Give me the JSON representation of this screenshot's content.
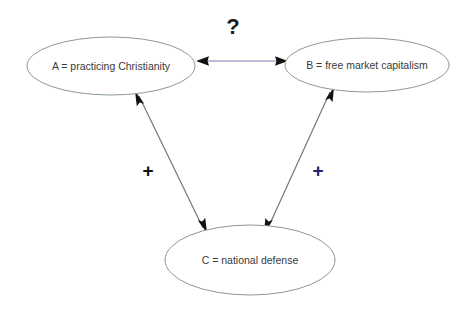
{
  "diagram": {
    "background_color": "#ffffff",
    "nodes": [
      {
        "id": "A",
        "label": "A = practicing Christianity",
        "cx": 111,
        "cy": 66,
        "rx": 84,
        "ry": 29,
        "fill": "#ffffff",
        "stroke": "#8a9a8e"
      },
      {
        "id": "B",
        "label": "B = free market capitalism",
        "cx": 367,
        "cy": 65,
        "rx": 82,
        "ry": 27,
        "fill": "#ffffff",
        "stroke": "#8a9a8e"
      },
      {
        "id": "C",
        "label": "C = national defense",
        "cx": 250,
        "cy": 260,
        "rx": 85,
        "ry": 35,
        "fill": "#ffffff",
        "stroke": "#8a9a8e"
      }
    ],
    "edges": [
      {
        "id": "edge-a-b",
        "from": "A",
        "to": "B",
        "arrows": "both",
        "label": "?",
        "label_x": 233,
        "label_y": 28,
        "label_color": "#1a1a1a",
        "line_color": "#7b7fae"
      },
      {
        "id": "edge-a-c",
        "from": "A",
        "to": "C",
        "arrows": "both",
        "label": "+",
        "label_x": 148,
        "label_y": 172,
        "label_color": "#121212",
        "line_color": "#6e6e72"
      },
      {
        "id": "edge-b-c",
        "from": "B",
        "to": "C",
        "arrows": "both",
        "label": "+",
        "label_x": 318,
        "label_y": 172,
        "label_color": "#23236b",
        "line_color": "#6e6e72"
      }
    ]
  }
}
